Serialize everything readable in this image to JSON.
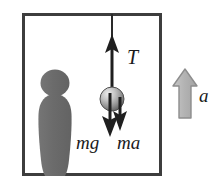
{
  "figure": {
    "background_color": "#ffffff",
    "box": {
      "x": 22,
      "y": 13,
      "width": 140,
      "height": 163,
      "border_color": "#3a3a3a",
      "border_width": 3,
      "fill_color": "#ffffff"
    },
    "person": {
      "name": "observer-silhouette",
      "color": "#6e6e6e",
      "head": {
        "cx": 55,
        "cy": 83,
        "r": 14
      },
      "body_top_y": 97,
      "body_bottom_y": 176
    },
    "ball": {
      "name": "hanging-ball",
      "cx": 112,
      "cy": 99,
      "r": 12,
      "highlight_color": "#e8e8e8",
      "mid_color": "#9a9a9a",
      "edge_color": "#4a4a4a"
    },
    "string": {
      "x": 112,
      "y_top": 14,
      "y_bottom": 99,
      "color": "#2a2a2a",
      "width": 2
    },
    "arrows": [
      {
        "name": "tension-arrow",
        "label": "T",
        "direction": "up",
        "color": "#1f1f1f",
        "x": 112,
        "tail_y": 99,
        "head_y": 35
      },
      {
        "name": "weight-arrow",
        "label": "mg",
        "direction": "down",
        "color": "#1f1f1f",
        "x": 110,
        "tail_y": 92,
        "head_y": 137
      },
      {
        "name": "pseudo-force-arrow",
        "label": "ma",
        "direction": "down",
        "color": "#1f1f1f",
        "x": 120,
        "tail_y": 96,
        "head_y": 130
      },
      {
        "name": "acceleration-arrow",
        "label": "a",
        "direction": "up",
        "style": "block",
        "fill_color": "#b5b5b5",
        "stroke_color": "#8a8a8a",
        "x": 185,
        "tail_y": 118,
        "head_y": 70
      }
    ],
    "labels": {
      "tension": "T",
      "weight": "mg",
      "pseudo_force": "ma",
      "acceleration": "a"
    }
  }
}
